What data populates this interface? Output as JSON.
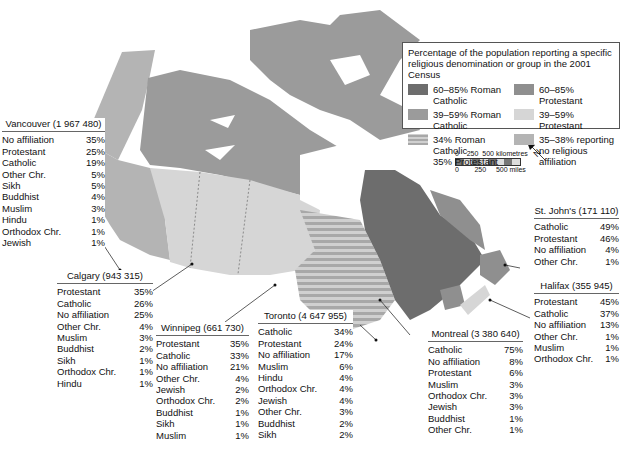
{
  "legend": {
    "title": "Percentage of the population reporting a specific religious denomination or group in the 2001 Census",
    "items": [
      {
        "label": "60–85% Roman Catholic",
        "color": "#6d6d6d",
        "pattern": "solid"
      },
      {
        "label": "60–85% Protestant",
        "color": "#8f8f8f",
        "pattern": "solid"
      },
      {
        "label": "39–59% Roman Catholic",
        "color": "#9b9b9b",
        "pattern": "solid"
      },
      {
        "label": "39–59% Protestant",
        "color": "#d6d6d6",
        "pattern": "solid"
      },
      {
        "label": "34% Roman Catholic\n35% Protestant",
        "line1": "34% Roman Catholic",
        "line2": "35% Protestant",
        "color": "#c4c4c4",
        "pattern": "stripes"
      },
      {
        "label": "35–38% reporting\nno religious affiliation",
        "line1": "35–38% reporting",
        "line2": "no religious affiliation",
        "color": "#b4b4b4",
        "pattern": "solid"
      }
    ]
  },
  "scale": {
    "km_labels": [
      "0",
      "250",
      "500 kilometres"
    ],
    "mi_labels": [
      "0",
      "250",
      "500 miles"
    ]
  },
  "north_arrow": {
    "label": "N"
  },
  "cities": [
    {
      "name": "Vancouver (1 967 480)",
      "rows": [
        [
          "No affiliation",
          "35%"
        ],
        [
          "Protestant",
          "25%"
        ],
        [
          "Catholic",
          "19%"
        ],
        [
          "Other Chr.",
          "5%"
        ],
        [
          "Sikh",
          "5%"
        ],
        [
          "Buddhist",
          "4%"
        ],
        [
          "Muslim",
          "3%"
        ],
        [
          "Hindu",
          "1%"
        ],
        [
          "Orthodox Chr.",
          "1%"
        ],
        [
          "Jewish",
          "1%"
        ]
      ]
    },
    {
      "name": "Calgary (943 315)",
      "rows": [
        [
          "Protestant",
          "35%"
        ],
        [
          "Catholic",
          "26%"
        ],
        [
          "No affiliation",
          "25%"
        ],
        [
          "Other Chr.",
          "4%"
        ],
        [
          "Muslim",
          "3%"
        ],
        [
          "Buddhist",
          "2%"
        ],
        [
          "Sikh",
          "1%"
        ],
        [
          "Orthodox Chr.",
          "1%"
        ],
        [
          "Hindu",
          "1%"
        ]
      ]
    },
    {
      "name": "Winnipeg (661 730)",
      "rows": [
        [
          "Protestant",
          "35%"
        ],
        [
          "Catholic",
          "33%"
        ],
        [
          "No affiliation",
          "21%"
        ],
        [
          "Other Chr.",
          "4%"
        ],
        [
          "Jewish",
          "2%"
        ],
        [
          "Orthodox Chr.",
          "2%"
        ],
        [
          "Buddhist",
          "1%"
        ],
        [
          "Sikh",
          "1%"
        ],
        [
          "Muslim",
          "1%"
        ]
      ]
    },
    {
      "name": "Toronto (4 647 955)",
      "rows": [
        [
          "Catholic",
          "34%"
        ],
        [
          "Protestant",
          "24%"
        ],
        [
          "No affiliation",
          "17%"
        ],
        [
          "Muslim",
          "6%"
        ],
        [
          "Hindu",
          "4%"
        ],
        [
          "Orthodox Chr.",
          "4%"
        ],
        [
          "Jewish",
          "4%"
        ],
        [
          "Other Chr.",
          "3%"
        ],
        [
          "Buddhist",
          "2%"
        ],
        [
          "Sikh",
          "2%"
        ]
      ]
    },
    {
      "name": "Montreal (3 380 640)",
      "rows": [
        [
          "Catholic",
          "75%"
        ],
        [
          "No affiliation",
          "8%"
        ],
        [
          "Protestant",
          "6%"
        ],
        [
          "Muslim",
          "3%"
        ],
        [
          "Orthodox Chr.",
          "3%"
        ],
        [
          "Jewish",
          "3%"
        ],
        [
          "Buddhist",
          "1%"
        ],
        [
          "Other Chr.",
          "1%"
        ]
      ]
    },
    {
      "name": "St. John's (171 110)",
      "rows": [
        [
          "Catholic",
          "49%"
        ],
        [
          "Protestant",
          "46%"
        ],
        [
          "No affiliation",
          "4%"
        ],
        [
          "Other Chr.",
          "1%"
        ]
      ]
    },
    {
      "name": "Halifax (355 945)",
      "rows": [
        [
          "Protestant",
          "45%"
        ],
        [
          "Catholic",
          "37%"
        ],
        [
          "No affiliation",
          "13%"
        ],
        [
          "Other Chr.",
          "1%"
        ],
        [
          "Muslim",
          "1%"
        ],
        [
          "Orthodox Chr.",
          "1%"
        ]
      ]
    }
  ],
  "regions": {
    "yukon": "#b4b4b4",
    "bc": "#b4b4b4",
    "nwt_nunavut": "#9b9b9b",
    "prairies": "#d6d6d6",
    "ontario": "stripes",
    "quebec": "#6d6d6d",
    "labrador_nl": "#8f8f8f",
    "maritimes": "#8f8f8f",
    "nova_scotia": "#d6d6d6"
  }
}
